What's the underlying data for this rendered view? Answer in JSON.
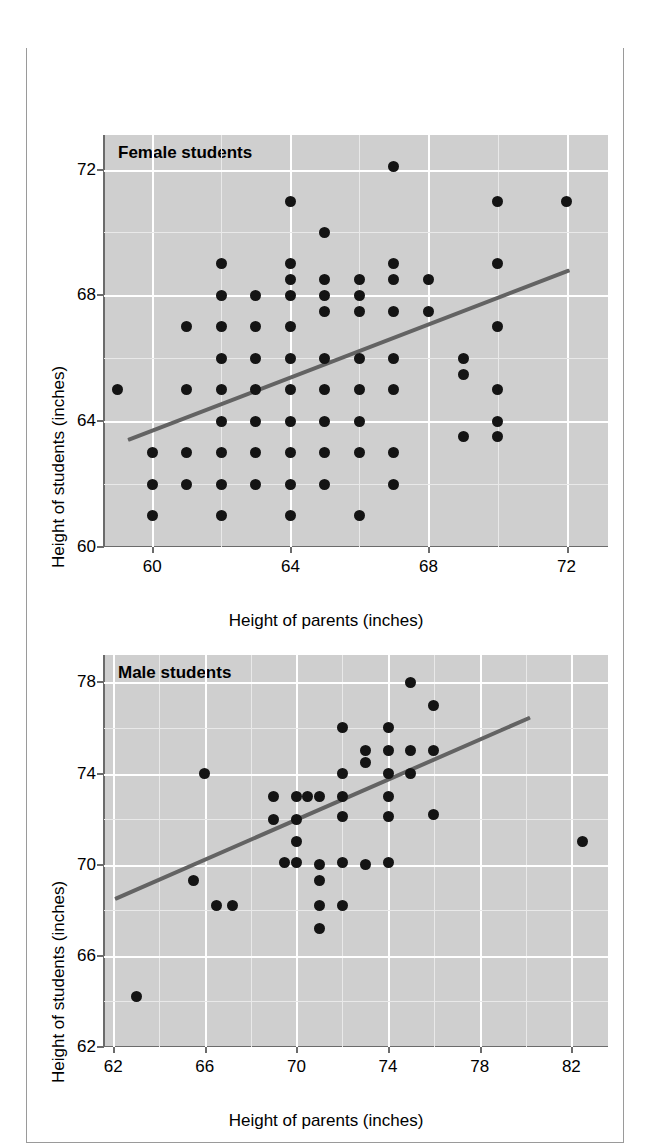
{
  "figure": {
    "title": "The heights of individuals and their same-sex parent are correlated",
    "title_bg": "#2b2b2b",
    "title_color": "#ffffff",
    "plot_bg": "#cfcfcf",
    "point_color": "#141414",
    "trend_color": "#636363"
  },
  "chart_data": [
    {
      "type": "scatter",
      "title": "Female students",
      "xlabel": "Height of parents (inches)",
      "ylabel": "Height of students (inches)",
      "xlim": [
        58.6,
        73.2
      ],
      "ylim": [
        60,
        73.1
      ],
      "xticks": [
        60,
        64,
        68,
        72
      ],
      "yticks": [
        60,
        64,
        68,
        72
      ],
      "grid": true,
      "legend": "none",
      "trendline": {
        "x0": 59.3,
        "y0": 63.45,
        "x1": 72.1,
        "y1": 68.85
      },
      "points": [
        [
          59.0,
          65.0
        ],
        [
          60.0,
          63.0
        ],
        [
          60.0,
          62.0
        ],
        [
          60.0,
          61.0
        ],
        [
          61.0,
          67.0
        ],
        [
          61.0,
          65.0
        ],
        [
          61.0,
          63.0
        ],
        [
          61.0,
          62.0
        ],
        [
          62.0,
          69.0
        ],
        [
          62.0,
          68.0
        ],
        [
          62.0,
          67.0
        ],
        [
          62.0,
          66.0
        ],
        [
          62.0,
          65.0
        ],
        [
          62.0,
          64.0
        ],
        [
          62.0,
          63.0
        ],
        [
          62.0,
          62.0
        ],
        [
          62.0,
          61.0
        ],
        [
          63.0,
          68.0
        ],
        [
          63.0,
          67.0
        ],
        [
          63.0,
          66.0
        ],
        [
          63.0,
          65.0
        ],
        [
          63.0,
          64.0
        ],
        [
          63.0,
          63.0
        ],
        [
          63.0,
          62.0
        ],
        [
          64.0,
          71.0
        ],
        [
          64.0,
          69.0
        ],
        [
          64.0,
          68.5
        ],
        [
          64.0,
          68.0
        ],
        [
          64.0,
          67.0
        ],
        [
          64.0,
          66.0
        ],
        [
          64.0,
          65.0
        ],
        [
          64.0,
          64.0
        ],
        [
          64.0,
          63.0
        ],
        [
          64.0,
          62.0
        ],
        [
          64.0,
          61.0
        ],
        [
          65.0,
          70.0
        ],
        [
          65.0,
          68.5
        ],
        [
          65.0,
          68.0
        ],
        [
          65.0,
          67.5
        ],
        [
          65.0,
          66.0
        ],
        [
          65.0,
          65.0
        ],
        [
          65.0,
          64.0
        ],
        [
          65.0,
          63.0
        ],
        [
          65.0,
          62.0
        ],
        [
          66.0,
          68.5
        ],
        [
          66.0,
          68.0
        ],
        [
          66.0,
          67.5
        ],
        [
          66.0,
          66.0
        ],
        [
          66.0,
          65.0
        ],
        [
          66.0,
          64.0
        ],
        [
          66.0,
          63.0
        ],
        [
          66.0,
          61.0
        ],
        [
          67.0,
          72.1
        ],
        [
          67.0,
          69.0
        ],
        [
          67.0,
          68.5
        ],
        [
          67.0,
          67.5
        ],
        [
          67.0,
          66.0
        ],
        [
          67.0,
          65.0
        ],
        [
          67.0,
          63.0
        ],
        [
          67.0,
          62.0
        ],
        [
          68.0,
          68.5
        ],
        [
          68.0,
          67.5
        ],
        [
          69.0,
          66.0
        ],
        [
          69.0,
          65.5
        ],
        [
          69.0,
          63.5
        ],
        [
          70.0,
          71.0
        ],
        [
          70.0,
          69.0
        ],
        [
          70.0,
          67.0
        ],
        [
          70.0,
          65.0
        ],
        [
          70.0,
          64.0
        ],
        [
          70.0,
          63.5
        ],
        [
          72.0,
          71.0
        ]
      ]
    },
    {
      "type": "scatter",
      "title": "Male students",
      "xlabel": "Height of parents (inches)",
      "ylabel": "Height of students (inches)",
      "xlim": [
        61.6,
        83.6
      ],
      "ylim": [
        62,
        79.2
      ],
      "xticks": [
        62,
        66,
        70,
        74,
        78,
        82
      ],
      "yticks": [
        62,
        66,
        70,
        74,
        78
      ],
      "grid": true,
      "legend": "none",
      "trendline": {
        "x0": 62.1,
        "y0": 68.6,
        "x1": 80.2,
        "y1": 76.55
      },
      "points": [
        [
          63.0,
          64.2
        ],
        [
          65.5,
          69.3
        ],
        [
          66.0,
          74.0
        ],
        [
          66.5,
          68.2
        ],
        [
          67.2,
          68.2
        ],
        [
          69.0,
          73.0
        ],
        [
          69.0,
          72.0
        ],
        [
          69.5,
          70.1
        ],
        [
          70.0,
          73.0
        ],
        [
          70.0,
          72.0
        ],
        [
          70.0,
          71.0
        ],
        [
          70.0,
          70.1
        ],
        [
          70.5,
          73.0
        ],
        [
          71.0,
          73.0
        ],
        [
          71.0,
          70.0
        ],
        [
          71.0,
          69.3
        ],
        [
          71.0,
          68.2
        ],
        [
          71.0,
          67.2
        ],
        [
          72.0,
          76.0
        ],
        [
          72.0,
          74.0
        ],
        [
          72.0,
          73.0
        ],
        [
          72.0,
          72.1
        ],
        [
          72.0,
          70.1
        ],
        [
          72.0,
          68.2
        ],
        [
          73.0,
          75.0
        ],
        [
          73.0,
          74.5
        ],
        [
          73.0,
          70.0
        ],
        [
          74.0,
          76.0
        ],
        [
          74.0,
          75.0
        ],
        [
          74.0,
          74.0
        ],
        [
          74.0,
          73.0
        ],
        [
          74.0,
          72.1
        ],
        [
          74.0,
          70.1
        ],
        [
          75.0,
          78.0
        ],
        [
          75.0,
          75.0
        ],
        [
          75.0,
          74.0
        ],
        [
          76.0,
          77.0
        ],
        [
          76.0,
          75.0
        ],
        [
          76.0,
          72.2
        ],
        [
          82.5,
          71.0
        ]
      ]
    }
  ]
}
